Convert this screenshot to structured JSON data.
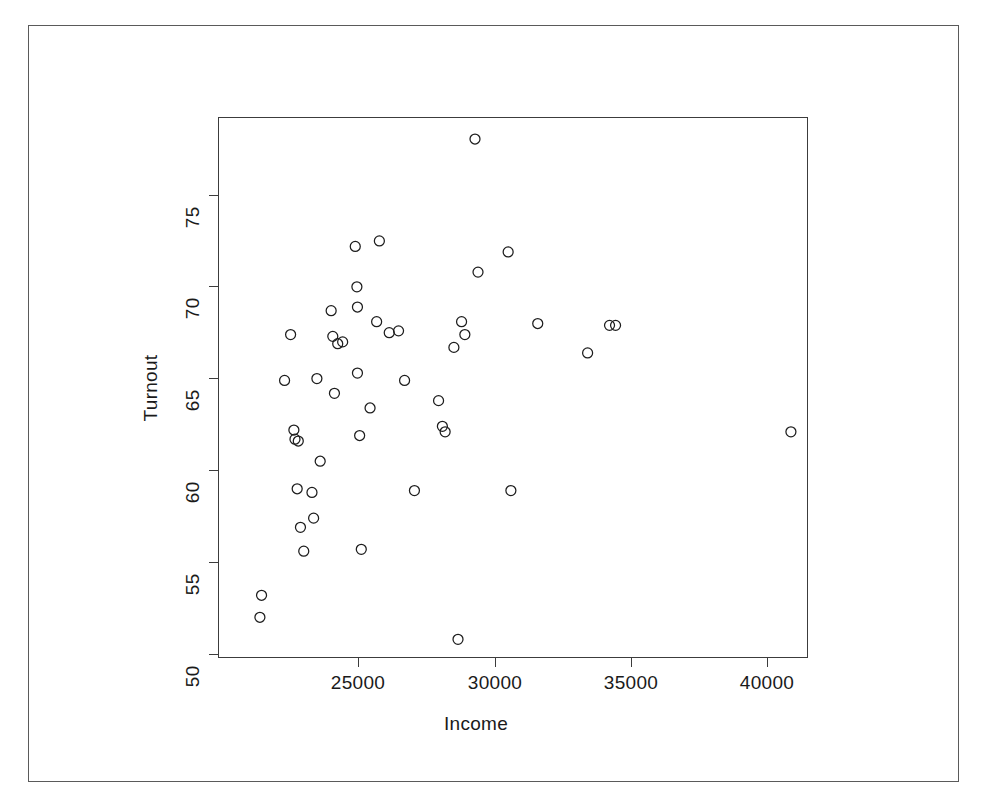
{
  "chart_data": {
    "type": "scatter",
    "title": "",
    "xlabel": "Income",
    "ylabel": "Turnout",
    "xlim": [
      21300,
      41300
    ],
    "ylim": [
      50.2,
      78.6
    ],
    "xticks": [
      25000,
      30000,
      35000,
      40000
    ],
    "xticklabels": [
      "25000",
      "30000",
      "35000",
      "40000"
    ],
    "yticks": [
      50,
      55,
      60,
      65,
      70,
      75
    ],
    "yticklabels": [
      "50",
      "55",
      "60",
      "65",
      "70",
      "75"
    ],
    "grid": false,
    "legend": null,
    "marker": "open-circle",
    "marker_color": "#1d1d1d",
    "n_points": 52,
    "points": [
      {
        "x": 21480,
        "y": 53.2
      },
      {
        "x": 21420,
        "y": 52.0
      },
      {
        "x": 22320,
        "y": 64.9
      },
      {
        "x": 22540,
        "y": 67.4
      },
      {
        "x": 22660,
        "y": 62.2
      },
      {
        "x": 22700,
        "y": 61.7
      },
      {
        "x": 22820,
        "y": 61.6
      },
      {
        "x": 22780,
        "y": 59.0
      },
      {
        "x": 22900,
        "y": 56.9
      },
      {
        "x": 23020,
        "y": 55.6
      },
      {
        "x": 23320,
        "y": 58.8
      },
      {
        "x": 23380,
        "y": 57.4
      },
      {
        "x": 23500,
        "y": 65.0
      },
      {
        "x": 23620,
        "y": 60.5
      },
      {
        "x": 24020,
        "y": 68.7
      },
      {
        "x": 24080,
        "y": 67.3
      },
      {
        "x": 24140,
        "y": 64.2
      },
      {
        "x": 24260,
        "y": 66.9
      },
      {
        "x": 24440,
        "y": 67.0
      },
      {
        "x": 24900,
        "y": 72.2
      },
      {
        "x": 24960,
        "y": 70.0
      },
      {
        "x": 24980,
        "y": 68.9
      },
      {
        "x": 24980,
        "y": 65.3
      },
      {
        "x": 25060,
        "y": 61.9
      },
      {
        "x": 25120,
        "y": 55.7
      },
      {
        "x": 25440,
        "y": 63.4
      },
      {
        "x": 25680,
        "y": 68.1
      },
      {
        "x": 25780,
        "y": 72.5
      },
      {
        "x": 26140,
        "y": 67.5
      },
      {
        "x": 26480,
        "y": 67.6
      },
      {
        "x": 26700,
        "y": 64.9
      },
      {
        "x": 27060,
        "y": 58.9
      },
      {
        "x": 27940,
        "y": 63.8
      },
      {
        "x": 28080,
        "y": 62.4
      },
      {
        "x": 28180,
        "y": 62.1
      },
      {
        "x": 28500,
        "y": 66.7
      },
      {
        "x": 28650,
        "y": 50.8
      },
      {
        "x": 28780,
        "y": 68.1
      },
      {
        "x": 28900,
        "y": 67.4
      },
      {
        "x": 29270,
        "y": 78.05
      },
      {
        "x": 29380,
        "y": 70.8
      },
      {
        "x": 30480,
        "y": 71.9
      },
      {
        "x": 30580,
        "y": 58.9
      },
      {
        "x": 31560,
        "y": 68.0
      },
      {
        "x": 33380,
        "y": 66.4
      },
      {
        "x": 34180,
        "y": 67.9
      },
      {
        "x": 34400,
        "y": 67.9
      },
      {
        "x": 40800,
        "y": 62.1
      }
    ]
  },
  "axes": {
    "x_label": "Income",
    "y_label": "Turnout",
    "x_tick_labels": [
      "25000",
      "30000",
      "35000",
      "40000"
    ],
    "y_tick_labels": [
      "50",
      "55",
      "60",
      "65",
      "70",
      "75"
    ]
  },
  "style": {
    "background": "#ffffff",
    "axis_color": "#3c3c3c",
    "frame_color": "#5a5a5a",
    "point_color": "#1d1d1d"
  }
}
